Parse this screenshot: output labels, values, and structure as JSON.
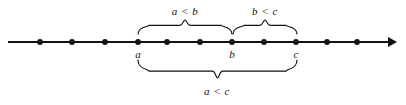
{
  "figure": {
    "background_color": "#ffffff",
    "ink_color": "#15120f",
    "axis": {
      "y": 42,
      "x_start": 8,
      "x_end": 397,
      "stroke_width": 2,
      "arrow_right": true
    },
    "ticks": [
      {
        "name": "dot-1",
        "x": 40,
        "label": ""
      },
      {
        "name": "dot-2",
        "x": 72,
        "label": ""
      },
      {
        "name": "dot-3",
        "x": 105,
        "label": ""
      },
      {
        "name": "dot-a",
        "x": 138,
        "label": "a"
      },
      {
        "name": "dot-5",
        "x": 167,
        "label": ""
      },
      {
        "name": "dot-6",
        "x": 200,
        "label": ""
      },
      {
        "name": "dot-b",
        "x": 232,
        "label": "b"
      },
      {
        "name": "dot-8",
        "x": 264,
        "label": ""
      },
      {
        "name": "dot-c",
        "x": 296,
        "label": "c"
      },
      {
        "name": "dot-10",
        "x": 327,
        "label": ""
      },
      {
        "name": "dot-11",
        "x": 357,
        "label": ""
      }
    ],
    "point_labels": [
      {
        "name": "axis-label-a",
        "text": "a",
        "x": 138,
        "y": 48
      },
      {
        "name": "axis-label-b",
        "text": "b",
        "x": 232,
        "y": 48
      },
      {
        "name": "axis-label-c",
        "text": "c",
        "x": 296,
        "y": 48
      }
    ],
    "braces": [
      {
        "name": "brace-a-lt-b",
        "orientation": "up",
        "x_left": 138,
        "x_right": 232,
        "base_y": 34,
        "peak_y": 20,
        "label": "a < b",
        "label_x": 185,
        "label_y": 11
      },
      {
        "name": "brace-b-lt-c",
        "orientation": "up",
        "x_left": 233,
        "x_right": 297,
        "base_y": 34,
        "peak_y": 20,
        "label": "b < c",
        "label_x": 265,
        "label_y": 11
      },
      {
        "name": "brace-a-lt-c",
        "orientation": "down",
        "x_left": 138,
        "x_right": 297,
        "base_y": 60,
        "peak_y": 78,
        "label": "a < c",
        "label_x": 217,
        "label_y": 91
      }
    ]
  }
}
